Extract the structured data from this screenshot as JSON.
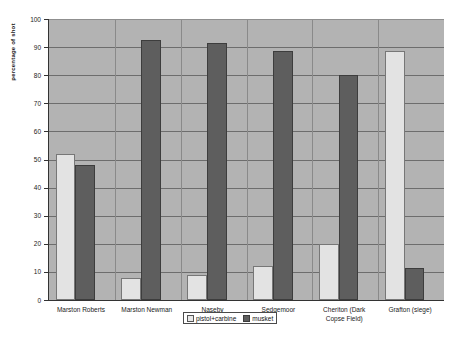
{
  "chart_data": {
    "type": "bar",
    "title": "",
    "xlabel": "",
    "ylabel": "percentage of shot",
    "ylim": [
      0,
      100
    ],
    "ytick_step": 10,
    "grid": true,
    "legend_position": "bottom-center",
    "categories": [
      "Marston Roberts",
      "Marston Newman",
      "Naseby",
      "Sedgemoor",
      "Cheriton (Dark Copse Field)",
      "Grafton (siege)"
    ],
    "yticks": [
      "0",
      "10",
      "20",
      "30",
      "40",
      "50",
      "60",
      "70",
      "80",
      "90",
      "100"
    ],
    "series": [
      {
        "name": "pistol+carbine",
        "color": "#e3e3e3",
        "values": [
          52,
          8,
          9,
          12,
          20,
          88.5
        ]
      },
      {
        "name": "musket",
        "color": "#5e5e5e",
        "values": [
          48,
          92.5,
          91.5,
          88.5,
          80,
          11.5
        ]
      }
    ]
  },
  "axis": {
    "y_title": "percentage of shot"
  },
  "category_labels": [
    {
      "line1": "Marston Roberts",
      "line2": ""
    },
    {
      "line1": "Marston Newman",
      "line2": ""
    },
    {
      "line1": "Naseby",
      "line2": ""
    },
    {
      "line1": "Sedgemoor",
      "line2": ""
    },
    {
      "line1": "Cheriton (Dark",
      "line2": "Copse Field)"
    },
    {
      "line1": "Grafton (siege)",
      "line2": ""
    }
  ],
  "legend": {
    "items": [
      {
        "label": "pistol+carbine",
        "swatch": "pistol"
      },
      {
        "label": "musket",
        "swatch": "musket"
      }
    ]
  },
  "colors": {
    "plot_background": "#b3b3b3",
    "gridline": "#555555",
    "pistol_carbine": "#e3e3e3",
    "musket": "#5e5e5e",
    "axis": "#333333"
  }
}
